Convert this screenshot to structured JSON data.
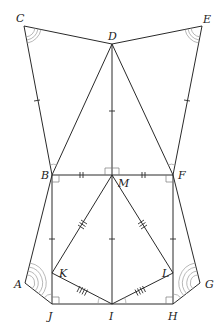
{
  "diagram": {
    "type": "geometry-figure",
    "points": {
      "C": {
        "label": "C",
        "x": 24,
        "y": 26,
        "lx": 16,
        "ly": 22
      },
      "D": {
        "label": "D",
        "x": 112,
        "y": 44,
        "lx": 108,
        "ly": 40
      },
      "E": {
        "label": "E",
        "x": 202,
        "y": 26,
        "lx": 203,
        "ly": 23
      },
      "B": {
        "label": "B",
        "x": 52,
        "y": 175,
        "lx": 41,
        "ly": 179
      },
      "M": {
        "label": "M",
        "x": 112,
        "y": 175,
        "lx": 118,
        "ly": 187
      },
      "F": {
        "label": "F",
        "x": 173,
        "y": 175,
        "lx": 178,
        "ly": 179
      },
      "K": {
        "label": "K",
        "x": 52,
        "y": 273,
        "lx": 59,
        "ly": 277
      },
      "L": {
        "label": "L",
        "x": 173,
        "y": 273,
        "lx": 162,
        "ly": 277
      },
      "A": {
        "label": "A",
        "x": 25,
        "y": 283,
        "lx": 14,
        "ly": 288
      },
      "G": {
        "label": "G",
        "x": 200,
        "y": 283,
        "lx": 205,
        "ly": 288
      },
      "J": {
        "label": "J",
        "x": 52,
        "y": 304,
        "lx": 48,
        "ly": 320
      },
      "I": {
        "label": "I",
        "x": 112,
        "y": 304,
        "lx": 108,
        "ly": 320
      },
      "H": {
        "label": "H",
        "x": 173,
        "y": 304,
        "lx": 168,
        "ly": 320
      }
    },
    "segments": [
      [
        "C",
        "D"
      ],
      [
        "D",
        "E"
      ],
      [
        "C",
        "B"
      ],
      [
        "E",
        "F"
      ],
      [
        "D",
        "B"
      ],
      [
        "D",
        "F"
      ],
      [
        "D",
        "M"
      ],
      [
        "B",
        "F"
      ],
      [
        "B",
        "J"
      ],
      [
        "F",
        "H"
      ],
      [
        "M",
        "I"
      ],
      [
        "M",
        "K"
      ],
      [
        "M",
        "L"
      ],
      [
        "K",
        "I"
      ],
      [
        "L",
        "I"
      ],
      [
        "B",
        "A"
      ],
      [
        "F",
        "G"
      ],
      [
        "A",
        "J"
      ],
      [
        "G",
        "H"
      ],
      [
        "J",
        "H"
      ]
    ],
    "tick_marks": [
      {
        "segment": [
          "C",
          "B"
        ],
        "count": 1
      },
      {
        "segment": [
          "E",
          "F"
        ],
        "count": 1
      },
      {
        "segment": [
          "D",
          "M"
        ],
        "count": 1
      },
      {
        "segment": [
          "B",
          "J"
        ],
        "count": 1
      },
      {
        "segment": [
          "M",
          "I"
        ],
        "count": 1
      },
      {
        "segment": [
          "F",
          "H"
        ],
        "count": 1
      },
      {
        "segment": [
          "B",
          "M"
        ],
        "count": 2
      },
      {
        "segment": [
          "M",
          "F"
        ],
        "count": 2
      },
      {
        "segment": [
          "M",
          "K"
        ],
        "count": 3
      },
      {
        "segment": [
          "M",
          "L"
        ],
        "count": 3
      },
      {
        "segment": [
          "K",
          "I"
        ],
        "count": 4
      },
      {
        "segment": [
          "L",
          "I"
        ],
        "count": 4
      }
    ],
    "right_angles": [
      "M (DM ⟂ BF)",
      "B (below BF)",
      "F (below BF)",
      "J",
      "H"
    ],
    "angle_arcs": [
      {
        "vertex": "C",
        "arcs": 3
      },
      {
        "vertex": "E",
        "arcs": 3
      },
      {
        "vertex": "A",
        "arcs": 4
      },
      {
        "vertex": "G",
        "arcs": 4
      },
      {
        "vertex": "B",
        "arcs": 1
      },
      {
        "vertex": "F",
        "arcs": 1
      },
      {
        "vertex": "J",
        "arcs": 1
      },
      {
        "vertex": "H",
        "arcs": 1
      },
      {
        "vertex": "I",
        "arcs": 2
      }
    ]
  }
}
